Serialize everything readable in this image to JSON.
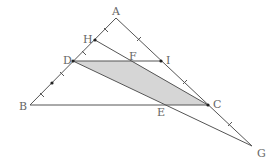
{
  "diagram": {
    "type": "geometry-triangle",
    "stroke_color": "#555555",
    "shade_color": "#d6d6d6",
    "points": {
      "A": {
        "x": 116,
        "y": 18,
        "label": "A"
      },
      "H": {
        "x": 95,
        "y": 40,
        "label": "H"
      },
      "D": {
        "x": 73,
        "y": 61,
        "label": "D"
      },
      "F": {
        "x": 132,
        "y": 61,
        "label": "F"
      },
      "I": {
        "x": 161,
        "y": 61,
        "label": "I"
      },
      "B": {
        "x": 30,
        "y": 105,
        "label": "B"
      },
      "E": {
        "x": 166,
        "y": 105,
        "label": "E"
      },
      "C": {
        "x": 208,
        "y": 105,
        "label": "C"
      },
      "G": {
        "x": 252,
        "y": 146,
        "label": "G"
      }
    },
    "segments": [
      "A-B",
      "A-G",
      "B-C",
      "D-I",
      "H-C",
      "D-G"
    ],
    "shaded_region": [
      "D",
      "F",
      "C",
      "E"
    ]
  }
}
